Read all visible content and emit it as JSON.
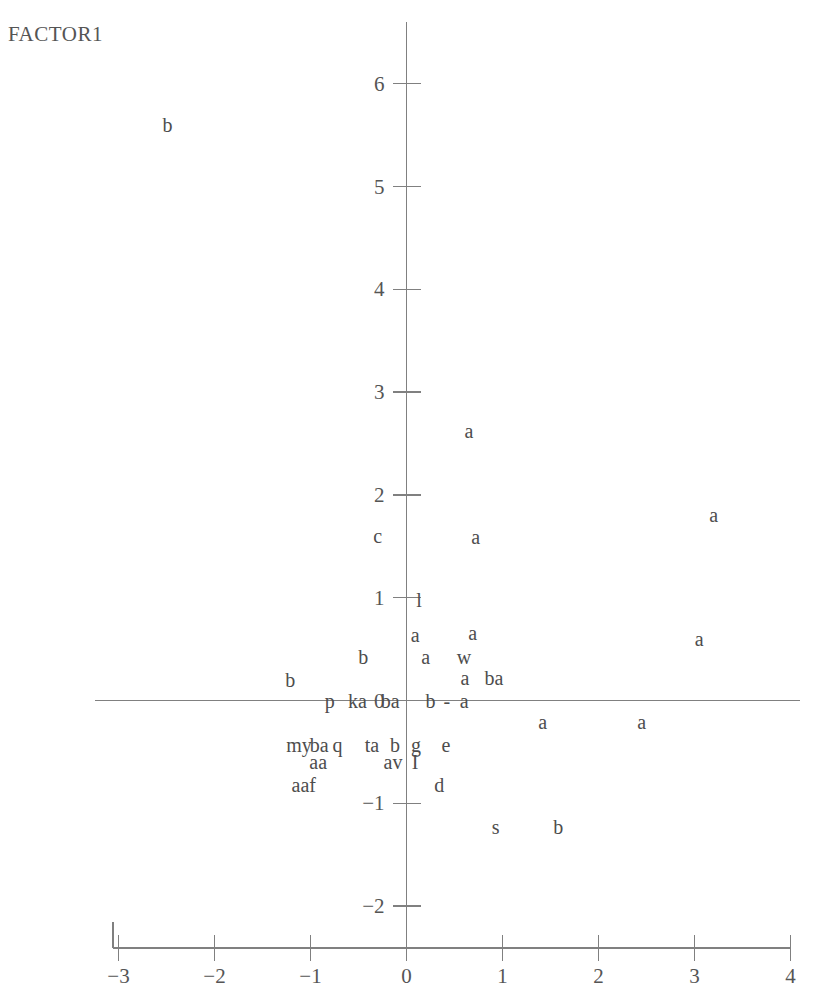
{
  "chart_data": {
    "type": "scatter",
    "title": "",
    "ylabel": "FACTOR1",
    "xlabel": "",
    "xlim": [
      -3.3,
      4.15
    ],
    "ylim": [
      -2.45,
      6.55
    ],
    "xticks": [
      -3,
      -2,
      -1,
      0,
      1,
      2,
      3,
      4
    ],
    "xticklabels": [
      "-3",
      "-2",
      "-1",
      "0",
      "1",
      "2",
      "3",
      "4"
    ],
    "yticks": [
      -2,
      -1,
      0,
      1,
      2,
      3,
      4,
      5,
      6
    ],
    "yticklabels": [
      "-2",
      "-1",
      "0",
      "1",
      "2",
      "3",
      "4",
      "5",
      "6"
    ],
    "grid": false,
    "legend": null,
    "marker_style": "text-letter",
    "axis_color": "#808080",
    "text_color": "#4d4d4d",
    "background": "#ffffff",
    "zero_lines": {
      "vertical_x": 0,
      "horizontal_y": 0
    },
    "points": [
      {
        "label": "b",
        "x": -2.49,
        "y": 5.6
      },
      {
        "label": "a",
        "x": 0.65,
        "y": 2.62
      },
      {
        "label": "a",
        "x": 3.2,
        "y": 1.8
      },
      {
        "label": "c",
        "x": -0.3,
        "y": 1.6
      },
      {
        "label": "a",
        "x": 0.72,
        "y": 1.59
      },
      {
        "label": "l",
        "x": 0.13,
        "y": 0.98
      },
      {
        "label": "a",
        "x": 0.09,
        "y": 0.64
      },
      {
        "label": "a",
        "x": 0.69,
        "y": 0.66
      },
      {
        "label": "a",
        "x": 3.05,
        "y": 0.6
      },
      {
        "label": "b",
        "x": -0.45,
        "y": 0.42
      },
      {
        "label": "a",
        "x": 0.2,
        "y": 0.42
      },
      {
        "label": "w",
        "x": 0.6,
        "y": 0.42
      },
      {
        "label": "a",
        "x": 0.61,
        "y": 0.22
      },
      {
        "label": "ba",
        "x": 0.91,
        "y": 0.22
      },
      {
        "label": "b",
        "x": -1.21,
        "y": 0.2
      },
      {
        "label": "p",
        "x": -0.8,
        "y": 0.0
      },
      {
        "label": "ka",
        "x": -0.51,
        "y": 0.0
      },
      {
        "label": "ba",
        "x": -0.17,
        "y": 0.0
      },
      {
        "label": "b",
        "x": 0.25,
        "y": 0.0
      },
      {
        "label": "-",
        "x": 0.42,
        "y": 0.0
      },
      {
        "label": "a",
        "x": 0.6,
        "y": 0.0
      },
      {
        "label": "a",
        "x": 1.42,
        "y": -0.21
      },
      {
        "label": "a",
        "x": 2.45,
        "y": -0.21
      },
      {
        "label": "my",
        "x": -1.12,
        "y": -0.43
      },
      {
        "label": "ba",
        "x": -0.91,
        "y": -0.43
      },
      {
        "label": "q",
        "x": -0.72,
        "y": -0.43
      },
      {
        "label": "ta",
        "x": -0.36,
        "y": -0.43
      },
      {
        "label": "b",
        "x": -0.12,
        "y": -0.43
      },
      {
        "label": "g",
        "x": 0.1,
        "y": -0.43
      },
      {
        "label": "e",
        "x": 0.41,
        "y": -0.43
      },
      {
        "label": "aa",
        "x": -0.92,
        "y": -0.6
      },
      {
        "label": "av",
        "x": -0.14,
        "y": -0.6
      },
      {
        "label": "I",
        "x": 0.09,
        "y": -0.6
      },
      {
        "label": "aaf",
        "x": -1.07,
        "y": -0.82
      },
      {
        "label": "d",
        "x": 0.34,
        "y": -0.82
      },
      {
        "label": "s",
        "x": 0.93,
        "y": -1.23
      },
      {
        "label": "b",
        "x": 1.58,
        "y": -1.23
      }
    ]
  }
}
